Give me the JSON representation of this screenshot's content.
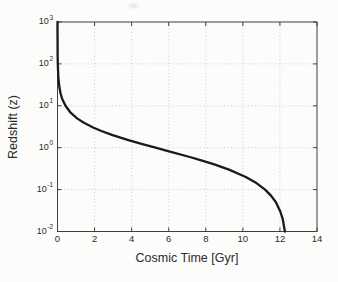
{
  "figure": {
    "background": "#fcfcfb"
  },
  "chart_data": {
    "type": "line",
    "title": "",
    "xlabel": "Cosmic Time [Gyr]",
    "ylabel": "Redshift (z)",
    "x_ticks": [
      0,
      2,
      4,
      6,
      8,
      10,
      12,
      14
    ],
    "y_tick_exponents": [
      3,
      2,
      1,
      0,
      -1,
      -2
    ],
    "xlim": [
      0,
      14
    ],
    "ylim": [
      0.01,
      1000
    ],
    "y_scale": "log",
    "grid": "dotted",
    "legend": "none",
    "colors": {
      "line": "#1a1a1a",
      "grid": "#cdcdcd",
      "axis": "#3f3f3f",
      "text": "#2b2b2b"
    },
    "series": [
      {
        "name": "redshift-vs-cosmic-time",
        "points": [
          [
            0.0005,
            1000
          ],
          [
            0.001,
            600
          ],
          [
            0.003,
            300
          ],
          [
            0.006,
            180
          ],
          [
            0.015,
            100
          ],
          [
            0.043,
            50
          ],
          [
            0.091,
            30
          ],
          [
            0.163,
            20
          ],
          [
            0.245,
            15
          ],
          [
            0.43,
            10
          ],
          [
            0.69,
            7
          ],
          [
            1.06,
            5
          ],
          [
            1.4,
            4
          ],
          [
            1.95,
            3
          ],
          [
            2.37,
            2.5
          ],
          [
            2.97,
            2
          ],
          [
            3.87,
            1.5
          ],
          [
            4.63,
            1.2
          ],
          [
            5.29,
            1
          ],
          [
            6.11,
            0.8
          ],
          [
            7.14,
            0.6
          ],
          [
            7.76,
            0.5
          ],
          [
            8.46,
            0.4
          ],
          [
            9.25,
            0.3
          ],
          [
            10.16,
            0.2
          ],
          [
            10.66,
            0.15
          ],
          [
            11.2,
            0.1
          ],
          [
            11.54,
            0.07
          ],
          [
            11.78,
            0.05
          ],
          [
            12.02,
            0.03
          ],
          [
            12.15,
            0.02
          ],
          [
            12.27,
            0.01
          ]
        ]
      }
    ]
  }
}
